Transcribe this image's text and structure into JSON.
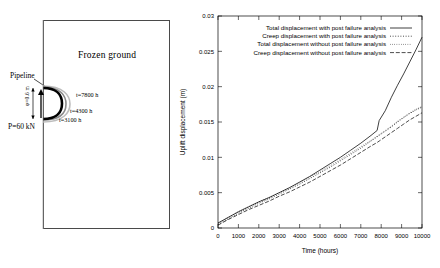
{
  "diagram": {
    "frozen_ground_label": "Frozen ground",
    "pipeline_label": "Pipeline",
    "load_label": "P=60 kN",
    "diameter_label": "φ=0.6 m",
    "contours": [
      {
        "name": "contour-7800",
        "label": "t=7800 h"
      },
      {
        "name": "contour-4300",
        "label": "t=4300 h"
      },
      {
        "name": "contour-3100",
        "label": "t=3100 h"
      }
    ]
  },
  "chart_data": {
    "type": "line",
    "title": "",
    "xlabel": "Time (hours)",
    "ylabel": "Uplift displacement (m)",
    "xlim": [
      0,
      10000
    ],
    "ylim": [
      0,
      0.03
    ],
    "grid": false,
    "legend_position": "top-center",
    "xticks": [
      0,
      1000,
      2000,
      3000,
      4000,
      5000,
      6000,
      7000,
      8000,
      9000,
      10000
    ],
    "xtick_labels": [
      "0",
      "1000",
      "2000",
      "3000",
      "4000",
      "5000",
      "6000",
      "7000",
      "8000",
      "9000",
      "10000"
    ],
    "yticks": [
      0,
      0.005,
      0.01,
      0.015,
      0.02,
      0.025,
      0.03
    ],
    "ytick_labels": [
      "0",
      "0.005",
      "0.01",
      "0.015",
      "0.02",
      "0.025",
      "0.03"
    ],
    "x": [
      0,
      250,
      500,
      1000,
      1500,
      2000,
      2500,
      3000,
      3500,
      4000,
      4500,
      5000,
      5500,
      6000,
      6500,
      7000,
      7500,
      7800,
      7900,
      8200,
      8500,
      8800,
      9100,
      9400,
      9700,
      10000
    ],
    "series": [
      {
        "name": "Total displacement with post failure analysis",
        "dash": "solid",
        "values": [
          0.0007,
          0.0011,
          0.0015,
          0.0023,
          0.003,
          0.0037,
          0.0043,
          0.005,
          0.0057,
          0.0065,
          0.0073,
          0.0082,
          0.0091,
          0.01,
          0.011,
          0.012,
          0.0131,
          0.0138,
          0.0152,
          0.0166,
          0.0185,
          0.0202,
          0.0218,
          0.0235,
          0.0252,
          0.027
        ]
      },
      {
        "name": "Creep displacement with post failure analysis",
        "dash": "dashed",
        "values": [
          0.0005,
          0.0009,
          0.0013,
          0.0021,
          0.0028,
          0.0035,
          0.0041,
          0.0048,
          0.0055,
          0.0062,
          0.007,
          0.0078,
          0.0086,
          0.0095,
          0.0104,
          0.0113,
          0.0123,
          0.0129,
          0.0131,
          0.0137,
          0.0143,
          0.015,
          0.0156,
          0.0162,
          0.0167,
          0.0171
        ]
      },
      {
        "name": "Total displacement without post failure analysis",
        "dash": "dotted",
        "values": [
          0.0007,
          0.0011,
          0.0015,
          0.0023,
          0.003,
          0.0037,
          0.0043,
          0.005,
          0.0057,
          0.0064,
          0.0072,
          0.008,
          0.0088,
          0.0097,
          0.0106,
          0.0115,
          0.0124,
          0.013,
          0.0132,
          0.0138,
          0.0144,
          0.0151,
          0.0157,
          0.0163,
          0.0168,
          0.0172
        ]
      },
      {
        "name": "Creep displacement without post failure analysis",
        "dash": "longdash",
        "values": [
          0.0004,
          0.0008,
          0.0012,
          0.0019,
          0.0026,
          0.0032,
          0.0038,
          0.0045,
          0.0051,
          0.0058,
          0.0065,
          0.0073,
          0.0081,
          0.0089,
          0.0098,
          0.0107,
          0.0116,
          0.0121,
          0.0123,
          0.0129,
          0.0135,
          0.0141,
          0.0147,
          0.0153,
          0.0158,
          0.0163
        ]
      }
    ]
  }
}
